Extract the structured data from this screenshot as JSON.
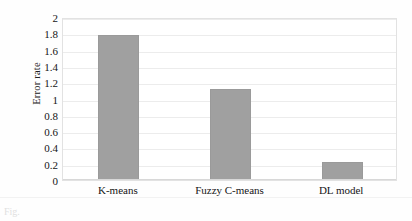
{
  "chart_data": {
    "type": "bar",
    "title": "",
    "xlabel": "",
    "ylabel": "Error rate",
    "categories": [
      "K-means",
      "Fuzzy C-means",
      "DL model"
    ],
    "values": [
      1.78,
      1.12,
      0.22
    ],
    "ylim": [
      0,
      2
    ],
    "ytick_labels": [
      "2",
      "1.8",
      "1.6",
      "1.4",
      "1.2",
      "1",
      "0.8",
      "0.6",
      "0.4",
      "0.2",
      "0"
    ],
    "ytick_values": [
      2,
      1.8,
      1.6,
      1.4,
      1.2,
      1,
      0.8,
      0.6,
      0.4,
      0.2,
      0
    ],
    "grid": true,
    "legend": "none",
    "bar_color": "#a0a0a0",
    "gridline_color": "#ececec",
    "plot_border_color": "#e2e2e2"
  },
  "caption": {
    "text": "Fig."
  }
}
